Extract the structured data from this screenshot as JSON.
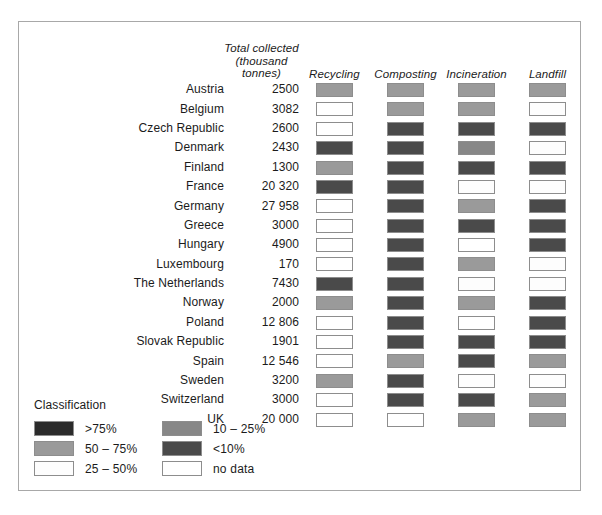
{
  "legend": {
    "title": "Classification",
    "items": [
      {
        "key": "gt75",
        "label": ">75%",
        "color": "#2b2b2b"
      },
      {
        "key": "p50_75",
        "label": "50 – 75%",
        "color": "#9a9a9a"
      },
      {
        "key": "p25_50",
        "label": "25 – 50%",
        "color": "#fdfdfd"
      },
      {
        "key": "p10_25",
        "label": "10 – 25%",
        "color": "#878787"
      },
      {
        "key": "lt10",
        "label": "<10%",
        "color": "#4a4a4a"
      },
      {
        "key": "nodata",
        "label": "no data",
        "color": "#ffffff"
      }
    ]
  },
  "chart_data": {
    "type": "heatmap",
    "title": "",
    "xlabel": "",
    "ylabel": "",
    "columns": [
      {
        "key": "country",
        "label": ""
      },
      {
        "key": "total",
        "label": "Total collected\n(thousand tonnes)"
      },
      {
        "key": "recycling",
        "label": "Recycling"
      },
      {
        "key": "composting",
        "label": "Composting"
      },
      {
        "key": "incineration",
        "label": "Incineration"
      },
      {
        "key": "landfill",
        "label": "Landfill"
      }
    ],
    "header": {
      "total_line1": "Total collected",
      "total_line2": "(thousand tonnes)",
      "recycling": "Recycling",
      "composting": "Composting",
      "incineration": "Incineration",
      "landfill": "Landfill"
    },
    "categories": [
      "Recycling",
      "Composting",
      "Incineration",
      "Landfill"
    ],
    "class_colors": {
      "gt75": "#2b2b2b",
      "p50_75": "#9a9a9a",
      "p25_50": "#fdfdfd",
      "p10_25": "#878787",
      "lt10": "#4a4a4a",
      "nodata": "#ffffff"
    },
    "rows": [
      {
        "country": "Austria",
        "total": "2500",
        "recycling": "p50_75",
        "composting": "p50_75",
        "incineration": "p50_75",
        "landfill": "p50_75"
      },
      {
        "country": "Belgium",
        "total": "3082",
        "recycling": "nodata",
        "composting": "p50_75",
        "incineration": "p50_75",
        "landfill": "p25_50"
      },
      {
        "country": "Czech Republic",
        "total": "2600",
        "recycling": "nodata",
        "composting": "lt10",
        "incineration": "lt10",
        "landfill": "lt10"
      },
      {
        "country": "Denmark",
        "total": "2430",
        "recycling": "lt10",
        "composting": "lt10",
        "incineration": "p10_25",
        "landfill": "p25_50"
      },
      {
        "country": "Finland",
        "total": "1300",
        "recycling": "p50_75",
        "composting": "lt10",
        "incineration": "lt10",
        "landfill": "lt10"
      },
      {
        "country": "France",
        "total": "20 320",
        "recycling": "lt10",
        "composting": "lt10",
        "incineration": "p25_50",
        "landfill": "p25_50"
      },
      {
        "country": "Germany",
        "total": "27 958",
        "recycling": "nodata",
        "composting": "lt10",
        "incineration": "p50_75",
        "landfill": "lt10"
      },
      {
        "country": "Greece",
        "total": "3000",
        "recycling": "nodata",
        "composting": "lt10",
        "incineration": "lt10",
        "landfill": "lt10"
      },
      {
        "country": "Hungary",
        "total": "4900",
        "recycling": "nodata",
        "composting": "lt10",
        "incineration": "nodata",
        "landfill": "lt10"
      },
      {
        "country": "Luxembourg",
        "total": "170",
        "recycling": "nodata",
        "composting": "lt10",
        "incineration": "p50_75",
        "landfill": "p25_50"
      },
      {
        "country": "The Netherlands",
        "total": "7430",
        "recycling": "lt10",
        "composting": "lt10",
        "incineration": "p25_50",
        "landfill": "p25_50"
      },
      {
        "country": "Norway",
        "total": "2000",
        "recycling": "p50_75",
        "composting": "lt10",
        "incineration": "p50_75",
        "landfill": "lt10"
      },
      {
        "country": "Poland",
        "total": "12 806",
        "recycling": "nodata",
        "composting": "lt10",
        "incineration": "nodata",
        "landfill": "lt10"
      },
      {
        "country": "Slovak Republic",
        "total": "1901",
        "recycling": "nodata",
        "composting": "lt10",
        "incineration": "lt10",
        "landfill": "lt10"
      },
      {
        "country": "Spain",
        "total": "12 546",
        "recycling": "nodata",
        "composting": "p50_75",
        "incineration": "lt10",
        "landfill": "p50_75"
      },
      {
        "country": "Sweden",
        "total": "3200",
        "recycling": "p50_75",
        "composting": "lt10",
        "incineration": "p25_50",
        "landfill": "p25_50"
      },
      {
        "country": "Switzerland",
        "total": "3000",
        "recycling": "nodata",
        "composting": "lt10",
        "incineration": "lt10",
        "landfill": "p50_75"
      },
      {
        "country": "UK",
        "total": "20 000",
        "recycling": "nodata",
        "composting": "nodata",
        "incineration": "p50_75",
        "landfill": "p50_75"
      }
    ]
  }
}
